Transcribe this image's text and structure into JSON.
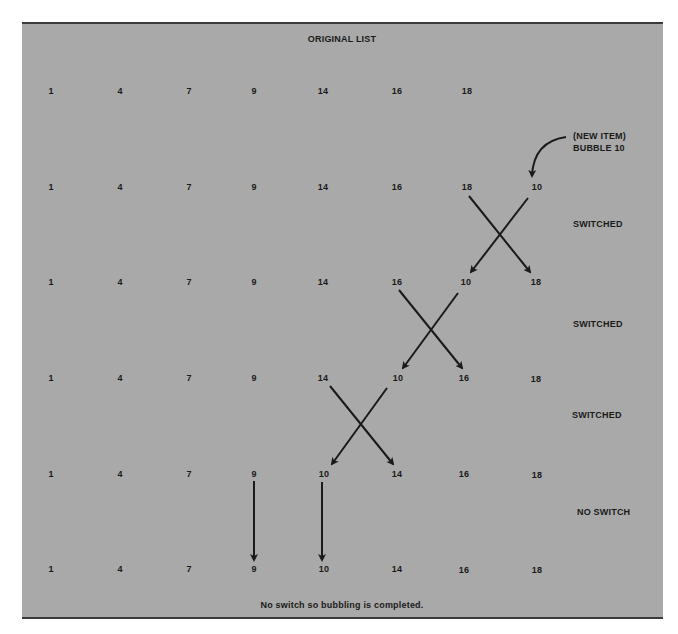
{
  "title": "ORIGINAL LIST",
  "new_item_note": {
    "line1": "(NEW ITEM)",
    "line2": "BUBBLE 10"
  },
  "rows": [
    {
      "values": [
        "1",
        "4",
        "7",
        "9",
        "14",
        "16",
        "18"
      ],
      "status": ""
    },
    {
      "values": [
        "1",
        "4",
        "7",
        "9",
        "14",
        "16",
        "18",
        "10"
      ],
      "status": "SWITCHED"
    },
    {
      "values": [
        "1",
        "4",
        "7",
        "9",
        "14",
        "16",
        "10",
        "18"
      ],
      "status": "SWITCHED"
    },
    {
      "values": [
        "1",
        "4",
        "7",
        "9",
        "14",
        "10",
        "16",
        "18"
      ],
      "status": "SWITCHED"
    },
    {
      "values": [
        "1",
        "4",
        "7",
        "9",
        "10",
        "14",
        "16",
        "18"
      ],
      "status": "NO SWITCH"
    },
    {
      "values": [
        "1",
        "4",
        "7",
        "9",
        "10",
        "14",
        "16",
        "18"
      ],
      "status": ""
    }
  ],
  "footer": "No switch so bubbling is completed.",
  "colors": {
    "background": "#a9a9a9",
    "ink": "#1a1a1a",
    "border": "#3a3a3a"
  }
}
